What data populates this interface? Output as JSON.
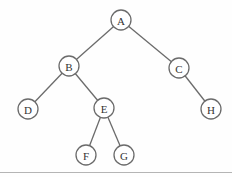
{
  "diagram": {
    "type": "binary-tree",
    "colors": {
      "edge": "#6b6b6b",
      "node_stroke": "#6b6b6b",
      "node_fill": "#ffffff",
      "label": "#333333",
      "bottom_rule": "#b5b5b5"
    },
    "nodes": [
      {
        "id": "A",
        "label": "A",
        "x": 121,
        "y": 20
      },
      {
        "id": "B",
        "label": "B",
        "x": 69,
        "y": 66
      },
      {
        "id": "C",
        "label": "C",
        "x": 179,
        "y": 68
      },
      {
        "id": "D",
        "label": "D",
        "x": 28,
        "y": 109
      },
      {
        "id": "E",
        "label": "E",
        "x": 104,
        "y": 108
      },
      {
        "id": "H",
        "label": "H",
        "x": 211,
        "y": 109
      },
      {
        "id": "F",
        "label": "F",
        "x": 86,
        "y": 155
      },
      {
        "id": "G",
        "label": "G",
        "x": 124,
        "y": 155
      }
    ],
    "edges": [
      {
        "from": "A",
        "to": "B"
      },
      {
        "from": "A",
        "to": "C"
      },
      {
        "from": "B",
        "to": "D"
      },
      {
        "from": "B",
        "to": "E"
      },
      {
        "from": "C",
        "to": "H"
      },
      {
        "from": "E",
        "to": "F"
      },
      {
        "from": "E",
        "to": "G"
      }
    ],
    "node_radius": 10
  }
}
